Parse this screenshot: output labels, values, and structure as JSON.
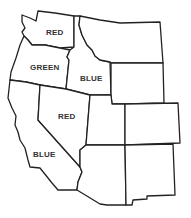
{
  "map": {
    "type": "outline map of western United States",
    "stroke_color": "#222222",
    "background": "#ffffff",
    "states": [
      {
        "id": "washington",
        "label": "RED"
      },
      {
        "id": "oregon",
        "label": "GREEN"
      },
      {
        "id": "idaho",
        "label": "BLUE"
      },
      {
        "id": "nevada",
        "label": "RED"
      },
      {
        "id": "california",
        "label": "BLUE"
      },
      {
        "id": "montana",
        "label": ""
      },
      {
        "id": "wyoming",
        "label": ""
      },
      {
        "id": "utah",
        "label": ""
      },
      {
        "id": "colorado",
        "label": ""
      },
      {
        "id": "arizona",
        "label": ""
      },
      {
        "id": "new-mexico",
        "label": ""
      }
    ]
  }
}
